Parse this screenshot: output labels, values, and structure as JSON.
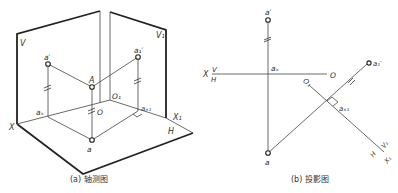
{
  "figure_a": {
    "caption": "(a) 轴测图",
    "labels": {
      "V": "V",
      "V1": "V₁",
      "a_prime": "a′",
      "a1_prime": "a₁′",
      "A": "A",
      "O1": "O₁",
      "O": "O",
      "ax": "aₓ",
      "ax1": "aₓ₁",
      "X": "X",
      "X1": "X₁",
      "H": "H",
      "a": "a"
    }
  },
  "figure_b": {
    "caption": "(b) 投影图",
    "labels": {
      "a_prime": "a′",
      "ax": "aₓ",
      "X": "X",
      "V": "V",
      "H": "H",
      "O": "O",
      "O1": "O₁",
      "a1_prime": "a₁′",
      "ax1": "aₓ₁",
      "V1": "V₁",
      "H2": "H",
      "X1": "X₁",
      "a": "a"
    }
  },
  "colors": {
    "line": "#444444",
    "thick": "#222222",
    "text": "#333333"
  }
}
